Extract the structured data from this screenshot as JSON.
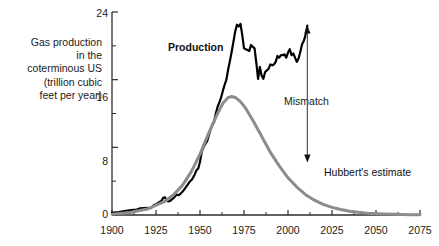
{
  "chart_data": {
    "type": "line",
    "title": "",
    "subtitle": "",
    "ylabel_lines": [
      "Gas production",
      "in the",
      "coterminous US",
      "(trillion cubic",
      "feet per year)"
    ],
    "ylabel": "Gas production in the coterminous US (trillion cubic feet per year)",
    "xlabel": "",
    "xlim": [
      1900,
      2075
    ],
    "ylim": [
      0,
      24
    ],
    "xticks": [
      1900,
      1925,
      1950,
      1975,
      2000,
      2025,
      2050,
      2075
    ],
    "xtick_labels": [
      "1900",
      "1925",
      "1950",
      "1975",
      "2000",
      "2025",
      "2050",
      "2075"
    ],
    "xticks_minor": [
      1912.5,
      1937.5,
      1962.5,
      1987.5,
      2012.5,
      2037.5,
      2062.5
    ],
    "yticks": [
      0,
      8,
      16,
      24
    ],
    "ytick_labels": [
      "0",
      "8",
      "16",
      "24"
    ],
    "yticks_minor": [
      4,
      12,
      20
    ],
    "grid": false,
    "legend_position": "inline-annotations",
    "series": [
      {
        "name": "Production",
        "label": "Production",
        "color": "#000000",
        "style": "solid",
        "width": 2.2,
        "label_x": 1956,
        "label_y": 20.3,
        "points": [
          [
            1900,
            0.25
          ],
          [
            1902,
            0.3
          ],
          [
            1904,
            0.35
          ],
          [
            1906,
            0.42
          ],
          [
            1908,
            0.5
          ],
          [
            1910,
            0.55
          ],
          [
            1912,
            0.6
          ],
          [
            1914,
            0.65
          ],
          [
            1916,
            0.78
          ],
          [
            1918,
            0.82
          ],
          [
            1920,
            0.85
          ],
          [
            1922,
            0.8
          ],
          [
            1924,
            1.2
          ],
          [
            1925,
            1.25
          ],
          [
            1926,
            1.4
          ],
          [
            1927,
            1.55
          ],
          [
            1928,
            1.65
          ],
          [
            1929,
            2.0
          ],
          [
            1930,
            2.1
          ],
          [
            1931,
            1.8
          ],
          [
            1932,
            1.6
          ],
          [
            1933,
            1.65
          ],
          [
            1934,
            1.85
          ],
          [
            1935,
            2.0
          ],
          [
            1936,
            2.25
          ],
          [
            1937,
            2.4
          ],
          [
            1938,
            2.35
          ],
          [
            1939,
            2.55
          ],
          [
            1940,
            2.75
          ],
          [
            1941,
            3.0
          ],
          [
            1942,
            3.3
          ],
          [
            1943,
            3.6
          ],
          [
            1944,
            3.9
          ],
          [
            1945,
            4.1
          ],
          [
            1946,
            4.4
          ],
          [
            1947,
            4.8
          ],
          [
            1948,
            5.3
          ],
          [
            1949,
            5.5
          ],
          [
            1950,
            6.3
          ],
          [
            1951,
            7.5
          ],
          [
            1952,
            8.0
          ],
          [
            1953,
            8.4
          ],
          [
            1954,
            8.7
          ],
          [
            1955,
            9.4
          ],
          [
            1956,
            10.1
          ],
          [
            1957,
            10.7
          ],
          [
            1958,
            11.0
          ],
          [
            1959,
            12.0
          ],
          [
            1960,
            12.8
          ],
          [
            1961,
            13.3
          ],
          [
            1962,
            13.9
          ],
          [
            1963,
            14.7
          ],
          [
            1964,
            15.4
          ],
          [
            1965,
            16.0
          ],
          [
            1966,
            17.2
          ],
          [
            1967,
            18.2
          ],
          [
            1968,
            19.3
          ],
          [
            1969,
            20.5
          ],
          [
            1970,
            21.7
          ],
          [
            1971,
            22.5
          ],
          [
            1972,
            22.3
          ],
          [
            1973,
            22.6
          ],
          [
            1974,
            21.3
          ],
          [
            1975,
            19.7
          ],
          [
            1976,
            19.6
          ],
          [
            1977,
            19.5
          ],
          [
            1978,
            19.4
          ],
          [
            1979,
            20.1
          ],
          [
            1980,
            19.9
          ],
          [
            1981,
            19.7
          ],
          [
            1982,
            18.0
          ],
          [
            1983,
            16.1
          ],
          [
            1984,
            17.5
          ],
          [
            1985,
            16.5
          ],
          [
            1986,
            16.1
          ],
          [
            1987,
            16.9
          ],
          [
            1988,
            17.1
          ],
          [
            1989,
            17.3
          ],
          [
            1990,
            17.8
          ],
          [
            1991,
            17.7
          ],
          [
            1992,
            17.8
          ],
          [
            1993,
            18.1
          ],
          [
            1994,
            18.8
          ],
          [
            1995,
            18.6
          ],
          [
            1996,
            18.9
          ],
          [
            1997,
            18.9
          ],
          [
            1998,
            19.0
          ],
          [
            1999,
            18.6
          ],
          [
            2000,
            19.2
          ],
          [
            2001,
            19.6
          ],
          [
            2002,
            18.9
          ],
          [
            2003,
            19.1
          ],
          [
            2004,
            18.6
          ],
          [
            2005,
            18.1
          ],
          [
            2006,
            18.5
          ],
          [
            2007,
            19.3
          ],
          [
            2008,
            20.2
          ],
          [
            2009,
            20.6
          ],
          [
            2010,
            21.3
          ],
          [
            2011,
            22.4
          ]
        ]
      },
      {
        "name": "Hubbert's estimate",
        "label": "Hubbert's estimate",
        "color": "#8c8c8c",
        "style": "solid",
        "width": 3.0,
        "label_x": 2022,
        "label_y": 3.1,
        "points": [
          [
            1900,
            0.1
          ],
          [
            1910,
            0.3
          ],
          [
            1920,
            0.7
          ],
          [
            1930,
            1.6
          ],
          [
            1935,
            2.4
          ],
          [
            1940,
            3.5
          ],
          [
            1945,
            5.1
          ],
          [
            1950,
            7.2
          ],
          [
            1955,
            9.7
          ],
          [
            1960,
            12.0
          ],
          [
            1963,
            13.2
          ],
          [
            1966,
            13.9
          ],
          [
            1968,
            14.0
          ],
          [
            1970,
            13.9
          ],
          [
            1973,
            13.4
          ],
          [
            1976,
            12.6
          ],
          [
            1980,
            11.2
          ],
          [
            1985,
            9.3
          ],
          [
            1990,
            7.4
          ],
          [
            1995,
            5.8
          ],
          [
            2000,
            4.4
          ],
          [
            2005,
            3.3
          ],
          [
            2010,
            2.4
          ],
          [
            2015,
            1.75
          ],
          [
            2020,
            1.25
          ],
          [
            2025,
            0.9
          ],
          [
            2030,
            0.65
          ],
          [
            2035,
            0.45
          ],
          [
            2040,
            0.32
          ],
          [
            2045,
            0.22
          ],
          [
            2050,
            0.16
          ],
          [
            2055,
            0.11
          ],
          [
            2060,
            0.08
          ],
          [
            2065,
            0.05
          ],
          [
            2070,
            0.03
          ],
          [
            2075,
            0.02
          ]
        ]
      }
    ],
    "annotations": [
      {
        "name": "mismatch",
        "text": "Mismatch",
        "type": "double-arrow",
        "x": 2011,
        "y_top": 22.4,
        "y_bottom": 6.2,
        "text_x": 2011,
        "text_y": 14.2,
        "color": "#555555"
      }
    ]
  },
  "colors": {
    "background": "#ffffff",
    "axis": "#2b2b2b",
    "production": "#000000",
    "hubbert": "#8c8c8c",
    "annotation": "#555555",
    "text": "#1a1a1a"
  }
}
